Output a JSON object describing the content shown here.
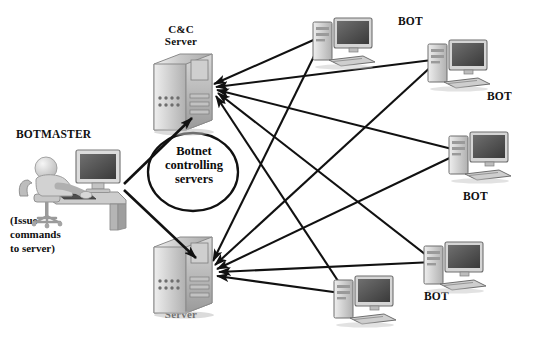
{
  "diagram": {
    "background_color": "#ffffff",
    "line_color": "#111111",
    "actor": {
      "label": "BOTMASTER",
      "icon": "person-at-desk-icon",
      "note_lines": [
        "(Issue",
        "commands",
        "to server)"
      ]
    },
    "group_label": {
      "lines": [
        "Botnet",
        "controlling",
        "servers"
      ],
      "shape": "ellipse"
    },
    "servers": [
      {
        "id": "cc-top",
        "label_lines": [
          "C&C",
          "Server"
        ],
        "label_position": "above",
        "icon": "server-tower-icon",
        "x": 150,
        "y": 50
      },
      {
        "id": "cc-bottom",
        "label_lines": [
          "C&C",
          "Server"
        ],
        "label_position": "below",
        "icon": "server-tower-icon",
        "x": 150,
        "y": 233
      }
    ],
    "bots": [
      {
        "id": "bot-1",
        "label": "BOT",
        "icon": "desktop-computer-icon",
        "x": 313,
        "y": 14,
        "label_x": 398,
        "label_y": 14
      },
      {
        "id": "bot-2",
        "label": "BOT",
        "icon": "desktop-computer-icon",
        "x": 428,
        "y": 36,
        "label_x": 487,
        "label_y": 90
      },
      {
        "id": "bot-3",
        "label": "BOT",
        "icon": "desktop-computer-icon",
        "x": 449,
        "y": 128,
        "label_x": 463,
        "label_y": 190
      },
      {
        "id": "bot-4",
        "label": "BOT",
        "icon": "desktop-computer-icon",
        "x": 424,
        "y": 238,
        "label_x": 424,
        "label_y": 290
      },
      {
        "id": "bot-5",
        "label": "BOT",
        "icon": "desktop-computer-icon",
        "x": 334,
        "y": 272,
        "label_x": 0,
        "label_y": 0
      }
    ],
    "bot_label_count": 4,
    "arrows": {
      "botmaster_to_servers": 2,
      "bots_to_top_server": 5,
      "bots_to_bottom_server": 5,
      "direction": "bots and botmaster point toward C&C servers"
    }
  }
}
